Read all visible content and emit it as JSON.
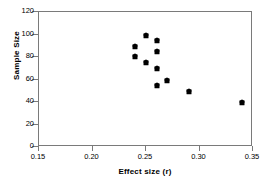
{
  "chart_data": {
    "type": "scatter",
    "title": "",
    "xlabel": "Effect size (r)",
    "ylabel": "Sample Size",
    "xlim": [
      0.15,
      0.35
    ],
    "ylim": [
      0,
      120
    ],
    "grid": false,
    "legend": null,
    "xticks": [
      0.15,
      0.2,
      0.25,
      0.3,
      0.35
    ],
    "xtick_labels": [
      "0.15",
      "0.20",
      "0.25",
      "0.30",
      "0.35"
    ],
    "yticks": [
      0,
      20,
      40,
      60,
      80,
      100,
      120
    ],
    "ytick_labels": [
      "0",
      "20",
      "40",
      "60",
      "80",
      "100",
      "120"
    ],
    "marker": "diamond",
    "marker_color": "#000000",
    "series": [
      {
        "name": "studies",
        "x": [
          0.24,
          0.24,
          0.25,
          0.25,
          0.26,
          0.26,
          0.26,
          0.26,
          0.27,
          0.29,
          0.34
        ],
        "y": [
          90,
          80.5,
          100,
          75.5,
          95.5,
          85,
          70.5,
          55.5,
          60,
          50,
          40
        ]
      }
    ],
    "points": [
      {
        "x": 0.24,
        "y": 90
      },
      {
        "x": 0.24,
        "y": 80.5
      },
      {
        "x": 0.25,
        "y": 100
      },
      {
        "x": 0.25,
        "y": 75.5
      },
      {
        "x": 0.26,
        "y": 95.5
      },
      {
        "x": 0.26,
        "y": 85
      },
      {
        "x": 0.26,
        "y": 70.5
      },
      {
        "x": 0.26,
        "y": 55.5
      },
      {
        "x": 0.27,
        "y": 60
      },
      {
        "x": 0.29,
        "y": 50
      },
      {
        "x": 0.34,
        "y": 40
      }
    ]
  },
  "axes": {
    "frame_color": "#7a7a7a",
    "x_title": "Effect size  (r)",
    "y_title": "Sample Size"
  }
}
